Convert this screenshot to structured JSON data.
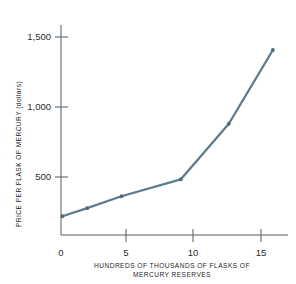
{
  "top_cut_text": "partially cropped header line",
  "chart_data": {
    "type": "line",
    "title": "",
    "xlabel": "HUNDREDS OF THOUSANDS OF FLASKS OF MERCURY RESERVES",
    "xlabel_line1": "HUNDREDS OF THOUSANDS OF FLASKS OF",
    "xlabel_line2": "MERCURY RESERVES",
    "ylabel": "PRICE PER FLASK OF MERCURY (dollars)",
    "xlim": [
      0,
      16.5
    ],
    "ylim": [
      0,
      1680
    ],
    "xticks": [
      0,
      5,
      10,
      15
    ],
    "xticklabels": [
      "0",
      "5",
      "10",
      "15"
    ],
    "yticks": [
      500,
      1000,
      1500
    ],
    "yticklabels": [
      "500",
      "1,000",
      "1,500"
    ],
    "grid": false,
    "legend": false,
    "series": [
      {
        "name": "Price per flask of mercury",
        "color": "#5d7b8b",
        "x": [
          0.1,
          1.9,
          4.4,
          8.7,
          12.2,
          15.4
        ],
        "y": [
          150,
          215,
          310,
          445,
          890,
          1480
        ]
      }
    ]
  },
  "axis_color": "#555b5e",
  "accent_color": "#5d7b8b"
}
